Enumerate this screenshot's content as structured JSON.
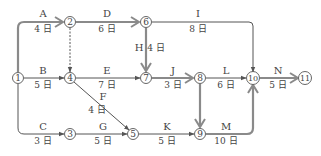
{
  "diagram": {
    "type": "arrow-network",
    "colors": {
      "critical": "#8a8a8a",
      "normal": "#555555",
      "node_stroke": "#555555",
      "text": "#444444"
    },
    "nodes": [
      {
        "id": "1",
        "label": "1",
        "x": 18,
        "y": 78
      },
      {
        "id": "2",
        "label": "2",
        "x": 70,
        "y": 22
      },
      {
        "id": "3",
        "label": "3",
        "x": 70,
        "y": 134
      },
      {
        "id": "4",
        "label": "4",
        "x": 70,
        "y": 78
      },
      {
        "id": "5",
        "label": "5",
        "x": 133,
        "y": 134
      },
      {
        "id": "6",
        "label": "6",
        "x": 146,
        "y": 22
      },
      {
        "id": "7",
        "label": "7",
        "x": 146,
        "y": 78
      },
      {
        "id": "8",
        "label": "8",
        "x": 200,
        "y": 78
      },
      {
        "id": "9",
        "label": "9",
        "x": 200,
        "y": 134
      },
      {
        "id": "10",
        "label": "10",
        "x": 253,
        "y": 78
      },
      {
        "id": "11",
        "label": "11",
        "x": 305,
        "y": 78
      }
    ],
    "activities": [
      {
        "name": "A",
        "from": "1",
        "to": "2",
        "duration": "4 日",
        "critical": true
      },
      {
        "name": "B",
        "from": "1",
        "to": "4",
        "duration": "5 日",
        "critical": false
      },
      {
        "name": "C",
        "from": "1",
        "to": "3",
        "duration": "3 日",
        "critical": false
      },
      {
        "name": "D",
        "from": "2",
        "to": "6",
        "duration": "6 日",
        "critical": true
      },
      {
        "name": "E",
        "from": "4",
        "to": "7",
        "duration": "7 日",
        "critical": false
      },
      {
        "name": "F",
        "from": "4",
        "to": "5",
        "duration": "4 日",
        "critical": false
      },
      {
        "name": "G",
        "from": "3",
        "to": "5",
        "duration": "5 日",
        "critical": false
      },
      {
        "name": "H",
        "from": "6",
        "to": "7",
        "duration": "4 日",
        "critical": true
      },
      {
        "name": "I",
        "from": "6",
        "to": "10",
        "duration": "8 日",
        "critical": false
      },
      {
        "name": "J",
        "from": "7",
        "to": "8",
        "duration": "3 日",
        "critical": true
      },
      {
        "name": "K",
        "from": "5",
        "to": "9",
        "duration": "5 日",
        "critical": false
      },
      {
        "name": "L",
        "from": "8",
        "to": "10",
        "duration": "6 日",
        "critical": false
      },
      {
        "name": "M",
        "from": "9",
        "to": "10",
        "duration": "10 日",
        "critical": true
      },
      {
        "name": "N",
        "from": "10",
        "to": "11",
        "duration": "5 日",
        "critical": true
      }
    ],
    "dummies": [
      {
        "from": "2",
        "to": "4",
        "style": "dashed",
        "critical": false
      },
      {
        "from": "8",
        "to": "9",
        "style": "solid",
        "critical": true
      }
    ]
  }
}
